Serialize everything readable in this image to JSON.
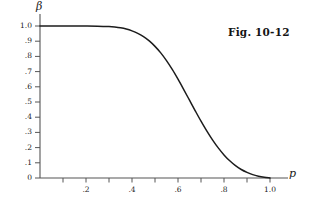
{
  "figure": {
    "caption": "Fig. 10-12",
    "background_color": "#ffffff",
    "curve_color": "#1c1c1c",
    "axis_color": "#555555"
  },
  "axes": {
    "y_symbol": "β",
    "x_symbol": "p"
  },
  "chart_data": {
    "type": "line",
    "title": "Fig. 10-12",
    "xlabel": "p",
    "ylabel": "β",
    "xlim": [
      0,
      1.0
    ],
    "ylim": [
      0,
      1.0
    ],
    "grid": false,
    "legend": "none",
    "x_major_ticks": [
      0.2,
      0.4,
      0.6,
      0.8,
      1.0
    ],
    "x_major_tick_labels": [
      ".2",
      ".4",
      ".6",
      ".8",
      "1.0"
    ],
    "x_minor_ticks": [
      0.1,
      0.3,
      0.5,
      0.7,
      0.9
    ],
    "y_major_ticks": [
      0,
      0.1,
      0.2,
      0.3,
      0.4,
      0.5,
      0.6,
      0.7,
      0.8,
      0.9,
      1.0
    ],
    "y_major_tick_labels": [
      "0",
      ".1",
      ".2",
      ".3",
      ".4",
      ".5",
      ".6",
      ".7",
      ".8",
      ".9",
      "1.0"
    ],
    "series": [
      {
        "name": "operating-characteristic-curve",
        "x": [
          0.0,
          0.05,
          0.1,
          0.15,
          0.2,
          0.25,
          0.3,
          0.325,
          0.35,
          0.375,
          0.4,
          0.425,
          0.45,
          0.475,
          0.5,
          0.525,
          0.55,
          0.575,
          0.6,
          0.625,
          0.65,
          0.675,
          0.7,
          0.725,
          0.75,
          0.775,
          0.8,
          0.825,
          0.85,
          0.875,
          0.9,
          0.925,
          0.95,
          0.975,
          1.0
        ],
        "y": [
          1.0,
          1.0,
          1.0,
          1.0,
          1.0,
          0.999,
          0.996,
          0.993,
          0.988,
          0.98,
          0.968,
          0.952,
          0.93,
          0.902,
          0.866,
          0.823,
          0.772,
          0.714,
          0.65,
          0.582,
          0.512,
          0.442,
          0.374,
          0.31,
          0.251,
          0.198,
          0.152,
          0.113,
          0.081,
          0.056,
          0.037,
          0.022,
          0.012,
          0.005,
          0.0
        ]
      }
    ]
  }
}
